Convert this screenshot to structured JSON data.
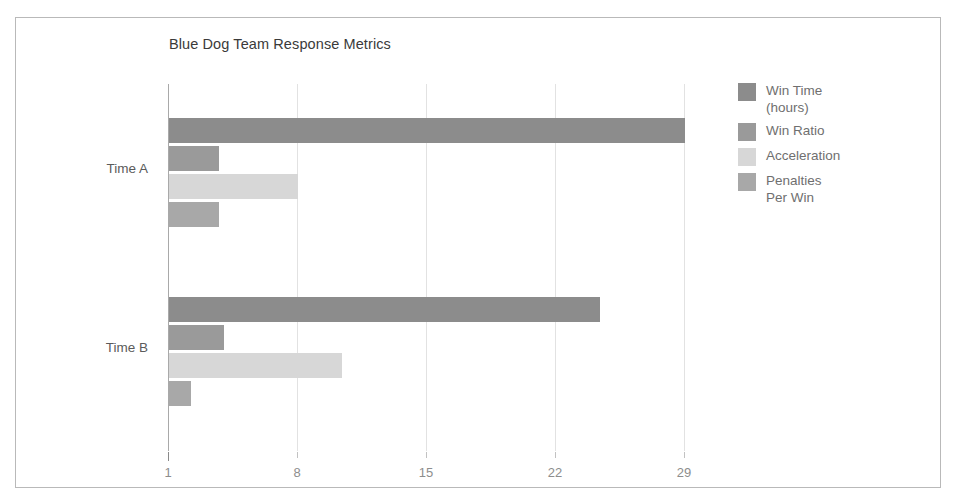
{
  "chart_data": {
    "type": "bar",
    "orientation": "horizontal",
    "title": "Blue Dog Team Response Metrics",
    "xlabel": "",
    "ylabel": "",
    "categories": [
      "Time A",
      "Time B"
    ],
    "series": [
      {
        "name": "Win Time (hours)",
        "color": "#8c8c8c",
        "values": [
          29,
          24.4
        ]
      },
      {
        "name": "Win Ratio",
        "color": "#9a9a9a",
        "values": [
          3.7,
          4.0
        ]
      },
      {
        "name": "Acceleration",
        "color": "#d7d7d7",
        "values": [
          8.0,
          10.4
        ]
      },
      {
        "name": "Penalties Per Win",
        "color": "#a8a8a8",
        "values": [
          3.7,
          2.2
        ]
      }
    ],
    "xticks": [
      1,
      8,
      15,
      22,
      29
    ],
    "xlim": [
      1,
      30
    ],
    "grid": true,
    "legend_position": "right",
    "plot_background": "#ffffff",
    "frame_border_color": "#b9b9b9",
    "gridline_color": "#e2e2e2",
    "axis_color": "#a9a9a9",
    "tick_label_color": "#8d8d8d"
  }
}
